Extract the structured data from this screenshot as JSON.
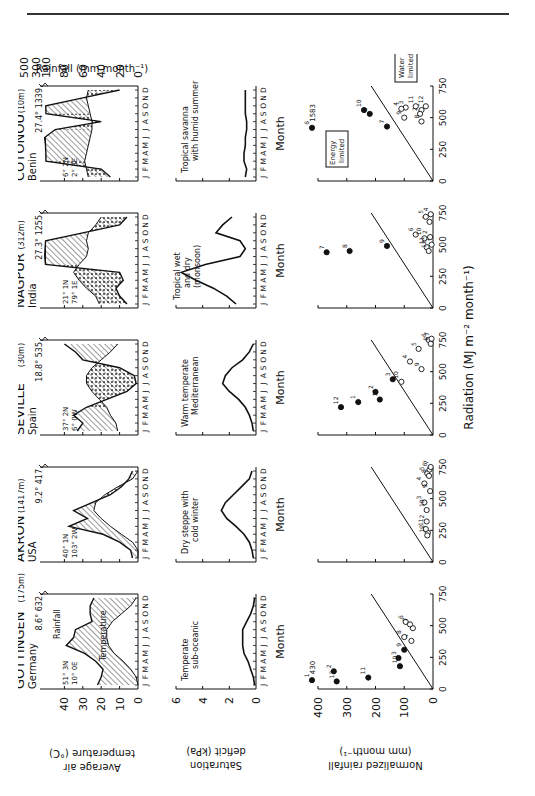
{
  "page": {
    "has_top_rule": true
  },
  "figure": {
    "orientation": "rotated-90-ccw",
    "row_labels": {
      "temperature_axis": "Average air temperature (°C)",
      "rainfall_axis": "Rainfall (mm month⁻¹)",
      "saturation_axis": "Saturation deficit (kPa)",
      "normalized_axis": "Normalized rainfall (mm month⁻¹)",
      "radiation_axis": "Radiation (MJ m⁻² month⁻¹)",
      "month_label": "Month",
      "month_ticks": "J F M A M J J A S O N D"
    },
    "temperature_ticks": [
      "0",
      "10",
      "20",
      "30",
      "40"
    ],
    "rainfall_ticks": [
      "0",
      "20",
      "40",
      "60",
      "80",
      "100",
      "300",
      "500"
    ],
    "saturation_ticks": [
      "0",
      "2",
      "4",
      "6"
    ],
    "normalized_ticks": [
      "0",
      "100",
      "200",
      "300",
      "400"
    ],
    "radiation_ticks": [
      "0",
      "250",
      "500",
      "750"
    ],
    "legend": {
      "rainfall": "Rainfall",
      "temperature": "Temperature",
      "energy_limited": "Energy limited",
      "water_limited": "Water limited"
    },
    "stations": [
      {
        "name": "GÖTTINGEN",
        "elev": "(175m)",
        "country": "Germany",
        "lat": "51° 3N",
        "lon": "10° 0E",
        "mean_temp": "8.6°",
        "annual_rain": "632",
        "climate": "Temperate sub-oceanic",
        "climate_l1": "Temperate",
        "climate_l2": "sub-oceanic",
        "outlier": "430"
      },
      {
        "name": "AKRON",
        "elev": "(1417m)",
        "country": "USA",
        "lat": "40° 1N",
        "lon": "103° 2W",
        "mean_temp": "9.2°",
        "annual_rain": "417",
        "climate": "Dry steppe with cold winter",
        "climate_l1": "Dry steppe with",
        "climate_l2": "cold winter"
      },
      {
        "name": "SEVILLE",
        "elev": "(30m)",
        "country": "Spain",
        "lat": "37° 2N",
        "lon": "6° 0W",
        "mean_temp": "18.8°",
        "annual_rain": "535",
        "climate": "Warm temperate Mediterranean",
        "climate_l1": "Warm temperate",
        "climate_l2": "Mediterranean"
      },
      {
        "name": "NAGPUR",
        "elev": "(312m)",
        "country": "India",
        "lat": "21° 1N",
        "lon": "79° 1E",
        "mean_temp": "27.3°",
        "annual_rain": "1255",
        "climate": "Tropical wet and dry (monsoon)",
        "climate_l1": "Tropical wet",
        "climate_l2": "and dry",
        "climate_l3": "(monsoon)"
      },
      {
        "name": "COTONOU",
        "elev": "(10m)",
        "country": "Benin",
        "lat": "6° 2N",
        "lon": "2° 3E",
        "mean_temp": "27.4°",
        "annual_rain": "1339",
        "climate": "Tropical savanna with humid summer",
        "climate_l1": "Tropical savanna",
        "climate_l2": "with humid summer",
        "outlier": "1583"
      }
    ]
  },
  "chart_data": [
    {
      "type": "area",
      "title": "Climate diagrams (Walter-type): monthly temperature and rainfall",
      "xlabel": "Month",
      "ylabel": "Average air temperature (°C) / Rainfall (mm month⁻¹)",
      "categories": [
        "J",
        "F",
        "M",
        "A",
        "M",
        "J",
        "J",
        "A",
        "S",
        "O",
        "N",
        "D"
      ],
      "series": [
        {
          "name": "Göttingen temperature",
          "values": [
            0,
            1,
            4,
            8,
            13,
            16,
            17,
            17,
            14,
            9,
            4,
            1
          ]
        },
        {
          "name": "Göttingen rainfall",
          "values": [
            44,
            40,
            38,
            46,
            58,
            78,
            70,
            68,
            50,
            52,
            52,
            48
          ]
        },
        {
          "name": "Akron temperature",
          "values": [
            -3,
            0,
            3,
            9,
            15,
            20,
            24,
            23,
            18,
            11,
            3,
            -1
          ]
        },
        {
          "name": "Akron rainfall",
          "values": [
            6,
            8,
            20,
            38,
            75,
            55,
            70,
            50,
            30,
            18,
            10,
            6
          ]
        },
        {
          "name": "Seville temperature",
          "values": [
            11,
            12,
            15,
            17,
            21,
            25,
            28,
            28,
            25,
            20,
            15,
            11
          ]
        },
        {
          "name": "Seville rainfall",
          "values": [
            66,
            60,
            70,
            56,
            34,
            12,
            2,
            4,
            20,
            60,
            68,
            80
          ]
        },
        {
          "name": "Nagpur temperature",
          "values": [
            21,
            23,
            28,
            32,
            35,
            32,
            28,
            27,
            28,
            27,
            23,
            20
          ]
        },
        {
          "name": "Nagpur rainfall",
          "values": [
            12,
            20,
            24,
            16,
            20,
            200,
            360,
            290,
            180,
            60,
            20,
            12
          ]
        },
        {
          "name": "Cotonou temperature",
          "values": [
            27,
            28,
            29,
            28,
            27,
            26,
            25,
            25,
            26,
            27,
            28,
            27
          ]
        },
        {
          "name": "Cotonou rainfall",
          "values": [
            30,
            40,
            110,
            130,
            200,
            370,
            90,
            40,
            110,
            140,
            60,
            20
          ]
        }
      ]
    },
    {
      "type": "line",
      "title": "Saturation deficit",
      "xlabel": "Month",
      "ylabel": "Saturation deficit (kPa)",
      "ylim": [
        0,
        6
      ],
      "categories": [
        "J",
        "F",
        "M",
        "A",
        "M",
        "J",
        "J",
        "A",
        "S",
        "O",
        "N",
        "D"
      ],
      "series": [
        {
          "name": "Göttingen",
          "values": [
            0.1,
            0.2,
            0.4,
            0.6,
            0.9,
            1.0,
            1.0,
            1.0,
            0.7,
            0.4,
            0.2,
            0.1
          ]
        },
        {
          "name": "Akron",
          "values": [
            0.2,
            0.3,
            0.5,
            0.9,
            1.5,
            2.2,
            2.6,
            2.3,
            1.7,
            1.1,
            0.5,
            0.3
          ]
        },
        {
          "name": "Seville",
          "values": [
            0.2,
            0.3,
            0.5,
            0.8,
            1.3,
            2.0,
            2.5,
            2.3,
            1.8,
            1.0,
            0.5,
            0.2
          ]
        },
        {
          "name": "Nagpur",
          "values": [
            1.5,
            2.2,
            3.2,
            4.5,
            5.6,
            3.8,
            1.2,
            0.8,
            1.2,
            3.0,
            2.5,
            1.8
          ]
        },
        {
          "name": "Cotonou",
          "values": [
            0.8,
            0.7,
            0.9,
            0.9,
            0.8,
            0.8,
            0.7,
            0.7,
            0.8,
            0.8,
            0.8,
            0.8
          ]
        }
      ]
    },
    {
      "type": "scatter",
      "title": "Normalized rainfall vs radiation (numbers = month)",
      "xlabel": "Radiation (MJ m⁻² month⁻¹)",
      "ylabel": "Normalized rainfall (mm month⁻¹)",
      "xlim": [
        0,
        750
      ],
      "ylim": [
        0,
        400
      ],
      "annotations": [
        "Energy limited",
        "Water limited"
      ],
      "series": [
        {
          "name": "Göttingen",
          "points": [
            [
              70,
              430,
              1
            ],
            [
              140,
              345,
              2
            ],
            [
              245,
              120,
              3
            ],
            [
              380,
              75,
              4
            ],
            [
              480,
              70,
              5
            ],
            [
              530,
              95,
              6
            ],
            [
              510,
              80,
              7
            ],
            [
              410,
              100,
              8
            ],
            [
              310,
              100,
              9
            ],
            [
              180,
              115,
              10
            ],
            [
              90,
              225,
              11
            ],
            [
              60,
              335,
              12
            ]
          ]
        },
        {
          "name": "Akron",
          "points": [
            [
              230,
              18,
              1
            ],
            [
              320,
              22,
              2
            ],
            [
              470,
              30,
              3
            ],
            [
              620,
              30,
              4
            ],
            [
              700,
              20,
              5
            ],
            [
              730,
              12,
              6
            ],
            [
              750,
              8,
              7
            ],
            [
              680,
              14,
              8
            ],
            [
              560,
              10,
              9
            ],
            [
              410,
              22,
              10
            ],
            [
              260,
              25,
              11
            ],
            [
              210,
              20,
              12
            ]
          ]
        },
        {
          "name": "Seville",
          "points": [
            [
              260,
              260,
              1
            ],
            [
              340,
              200,
              2
            ],
            [
              440,
              140,
              3
            ],
            [
              580,
              80,
              4
            ],
            [
              680,
              50,
              5
            ],
            [
              750,
              15,
              6
            ],
            [
              760,
              5,
              7
            ],
            [
              720,
              8,
              8
            ],
            [
              520,
              40,
              9
            ],
            [
              420,
              110,
              10
            ],
            [
              280,
              185,
              11
            ],
            [
              220,
              320,
              12
            ]
          ]
        },
        {
          "name": "Nagpur",
          "points": [
            [
              500,
              5,
              1
            ],
            [
              560,
              10,
              2
            ],
            [
              680,
              12,
              3
            ],
            [
              740,
              8,
              4
            ],
            [
              720,
              25,
              5
            ],
            [
              580,
              60,
              6
            ],
            [
              440,
              370,
              7
            ],
            [
              450,
              290,
              8
            ],
            [
              490,
              160,
              9
            ],
            [
              550,
              30,
              10
            ],
            [
              480,
              22,
              11
            ],
            [
              450,
              15,
              12
            ]
          ]
        },
        {
          "name": "Cotonou",
          "points": [
            [
              560,
              40,
              1
            ],
            [
              530,
              45,
              2
            ],
            [
              580,
              95,
              3
            ],
            [
              570,
              110,
              4
            ],
            [
              530,
              220,
              5
            ],
            [
              420,
              1583,
              6
            ],
            [
              430,
              160,
              7
            ],
            [
              470,
              40,
              8
            ],
            [
              500,
              100,
              9
            ],
            [
              560,
              240,
              10
            ],
            [
              590,
              60,
              11
            ],
            [
              590,
              25,
              12
            ]
          ]
        }
      ]
    }
  ]
}
